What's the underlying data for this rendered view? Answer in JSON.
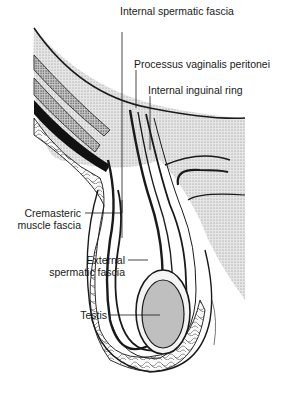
{
  "figure": {
    "labels": {
      "internal_spermatic_fascia": "Internal spermatic fascia",
      "processus_vaginalis": "Processus vaginalis peritonei",
      "internal_inguinal_ring": "Internal inguinal ring",
      "cremasteric_1": "Cremasteric",
      "cremasteric_2": "muscle fascia",
      "external_1": "External",
      "external_2": "spermatic fascia",
      "testis": "Testis"
    },
    "colors": {
      "ink": "#1a1a1a",
      "stipple_light": "#d9d9d9",
      "stipple_mid": "#bdbdbd",
      "background": "#ffffff"
    }
  }
}
